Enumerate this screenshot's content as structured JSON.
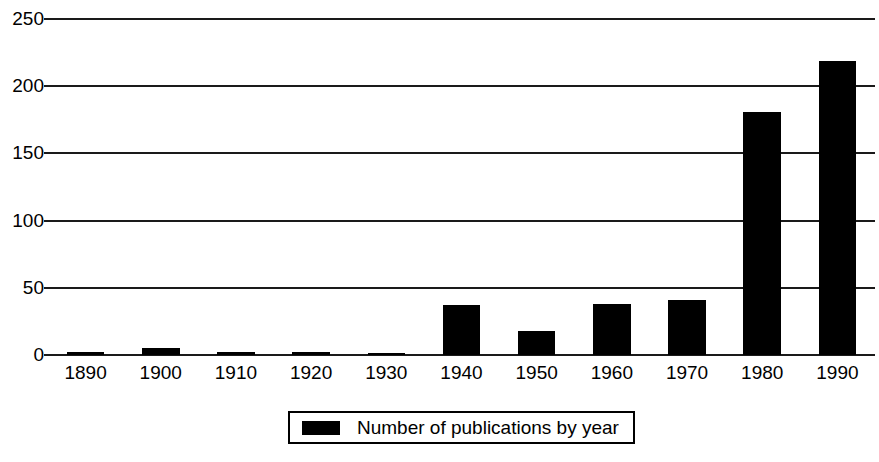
{
  "chart_data": {
    "type": "bar",
    "title": "",
    "subtitle": "",
    "xlabel": "",
    "ylabel": "",
    "categories": [
      "1890",
      "1900",
      "1910",
      "1920",
      "1930",
      "1940",
      "1950",
      "1960",
      "1970",
      "1980",
      "1990"
    ],
    "values": [
      2,
      5,
      2,
      2,
      1,
      37,
      18,
      38,
      41,
      181,
      219
    ],
    "series": [
      {
        "name": "Number of publications by year",
        "values": [
          2,
          5,
          2,
          2,
          1,
          37,
          18,
          38,
          41,
          181,
          219
        ]
      }
    ],
    "ylim": [
      0,
      250
    ],
    "yticks": [
      0,
      50,
      100,
      150,
      200,
      250
    ],
    "ytick_labels": [
      "0",
      "50",
      "100",
      "150",
      "200",
      "250"
    ],
    "grid": true,
    "grid_axis": "y",
    "legend": {
      "position": "bottom",
      "entries": [
        {
          "label": "Number of publications by year",
          "color": "#000000",
          "swatch": "filled-square"
        }
      ]
    },
    "bar_color": "#000000",
    "axis_color": "#1a1a1a",
    "background": "#ffffff"
  }
}
